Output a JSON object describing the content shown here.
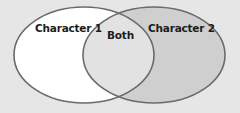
{
  "diagram": {
    "type": "venn",
    "sets": [
      {
        "id": "left",
        "label": "Character 1",
        "fill": "#ffffff"
      },
      {
        "id": "right",
        "label": "Character 2",
        "fill": "#cfcfcf"
      }
    ],
    "intersection": {
      "label": "Both",
      "fill": "#e2e2e2"
    },
    "colors": {
      "background": "#e6e6e6",
      "stroke": "#6a6a6a",
      "text": "#1c1c1c"
    }
  }
}
